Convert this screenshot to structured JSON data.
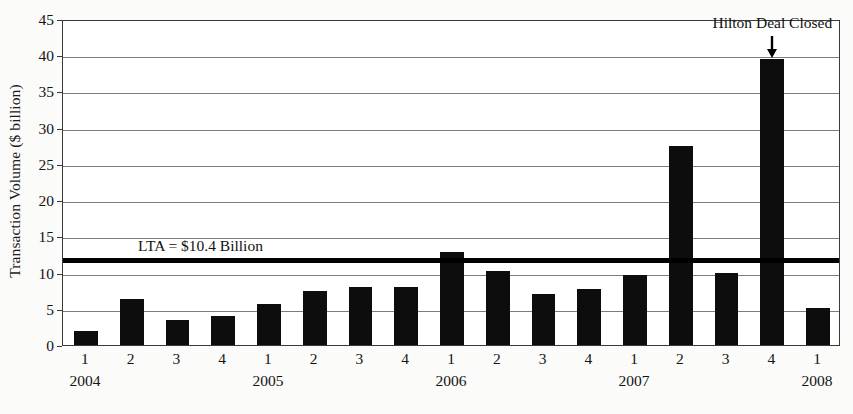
{
  "chart_data": {
    "type": "bar",
    "title": "",
    "xlabel": "",
    "ylabel": "Transaction Volume ($ billion)",
    "ylim": [
      0,
      45
    ],
    "ytick_step": 5,
    "yticks": [
      0,
      5,
      10,
      15,
      20,
      25,
      30,
      35,
      40,
      45
    ],
    "grid": true,
    "legend": "none",
    "bar_color": "#0d0d0d",
    "categories": [
      "2004 Q1",
      "2004 Q2",
      "2004 Q3",
      "2004 Q4",
      "2005 Q1",
      "2005 Q2",
      "2005 Q3",
      "2005 Q4",
      "2006 Q1",
      "2006 Q2",
      "2006 Q3",
      "2006 Q4",
      "2007 Q1",
      "2007 Q2",
      "2007 Q3",
      "2007 Q4",
      "2008 Q1"
    ],
    "quarter_labels": [
      "1",
      "2",
      "3",
      "4",
      "1",
      "2",
      "3",
      "4",
      "1",
      "2",
      "3",
      "4",
      "1",
      "2",
      "3",
      "4",
      "1"
    ],
    "year_labels": [
      {
        "year": "2004",
        "index": 0
      },
      {
        "year": "2005",
        "index": 4
      },
      {
        "year": "2006",
        "index": 8
      },
      {
        "year": "2007",
        "index": 12
      },
      {
        "year": "2008",
        "index": 16
      }
    ],
    "values": [
      1.9,
      6.4,
      3.5,
      4.0,
      5.6,
      7.4,
      8.0,
      8.0,
      12.8,
      10.2,
      7.0,
      7.7,
      9.6,
      27.5,
      9.9,
      39.5,
      5.1
    ],
    "reference_line": {
      "label": "LTA = $10.4 Billion",
      "value": 10.4,
      "drawn_at": 12.0,
      "color": "#000000"
    },
    "annotations": [
      {
        "text": "Hilton Deal Closed",
        "target_index": 15,
        "target_category": "2007 Q4",
        "target_value": 39.5,
        "arrow": "down-arrow-icon"
      }
    ]
  }
}
